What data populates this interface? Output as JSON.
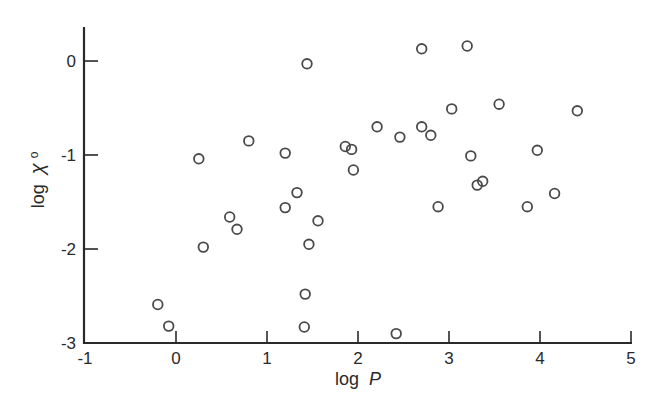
{
  "chart_data": {
    "type": "scatter",
    "title": "",
    "xlabel": "log P",
    "ylabel": "log X0",
    "xlim": [
      -1,
      5
    ],
    "ylim": [
      -3,
      0.35
    ],
    "grid": false,
    "legend": null,
    "x_ticks": [
      -1,
      0,
      1,
      2,
      3,
      4,
      5
    ],
    "x_tick_labels": [
      "-1",
      "0",
      "1",
      "2",
      "3",
      "4",
      "5"
    ],
    "y_ticks": [
      0,
      -1,
      -2,
      -3
    ],
    "y_tick_labels": [
      "0",
      "-1",
      "-2",
      "-3"
    ],
    "marker": "open-circle",
    "series": [
      {
        "name": "data",
        "points": [
          [
            0.25,
            -1.04
          ],
          [
            0.8,
            -0.85
          ],
          [
            1.2,
            -0.98
          ],
          [
            1.33,
            -1.4
          ],
          [
            1.2,
            -1.56
          ],
          [
            0.59,
            -1.66
          ],
          [
            0.67,
            -1.79
          ],
          [
            1.56,
            -1.7
          ],
          [
            0.3,
            -1.98
          ],
          [
            1.46,
            -1.95
          ],
          [
            1.44,
            -0.03
          ],
          [
            2.7,
            0.13
          ],
          [
            3.2,
            0.16
          ],
          [
            3.03,
            -0.51
          ],
          [
            2.21,
            -0.7
          ],
          [
            2.46,
            -0.81
          ],
          [
            2.7,
            -0.7
          ],
          [
            2.8,
            -0.79
          ],
          [
            1.86,
            -0.91
          ],
          [
            1.93,
            -0.94
          ],
          [
            3.24,
            -1.01
          ],
          [
            3.55,
            -0.46
          ],
          [
            4.41,
            -0.53
          ],
          [
            3.97,
            -0.95
          ],
          [
            3.31,
            -1.32
          ],
          [
            3.37,
            -1.28
          ],
          [
            4.16,
            -1.41
          ],
          [
            3.86,
            -1.55
          ],
          [
            1.95,
            -1.16
          ],
          [
            2.88,
            -1.55
          ],
          [
            -0.2,
            -2.59
          ],
          [
            -0.08,
            -2.82
          ],
          [
            1.42,
            -2.48
          ],
          [
            1.41,
            -2.83
          ],
          [
            2.42,
            -2.9
          ]
        ]
      }
    ]
  },
  "labels": {
    "x_axis_title": "log",
    "x_axis_var": "P",
    "y_axis_title": "log",
    "y_axis_var": "χ",
    "y_axis_sub": "o"
  },
  "colors": {
    "axis": "#2a2a2a",
    "marker": "#4a4a4a",
    "background": "#ffffff"
  }
}
